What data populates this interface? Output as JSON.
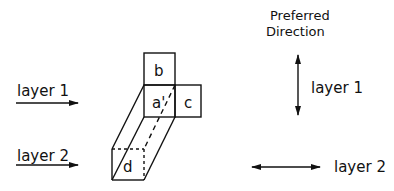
{
  "header": {
    "title_line1": "Preferred",
    "title_line2": "Direction"
  },
  "left_arrows": [
    {
      "label": "layer 1",
      "direction": "right"
    },
    {
      "label": "layer 2",
      "direction": "right"
    }
  ],
  "cells": {
    "a": "a'",
    "b": "b",
    "c": "c",
    "d": "d"
  },
  "preferred_directions": [
    {
      "label": "layer 1",
      "orientation": "vertical"
    },
    {
      "label": "layer 2",
      "orientation": "horizontal"
    }
  ],
  "colors": {
    "stroke": "#111111",
    "background": "#ffffff"
  }
}
